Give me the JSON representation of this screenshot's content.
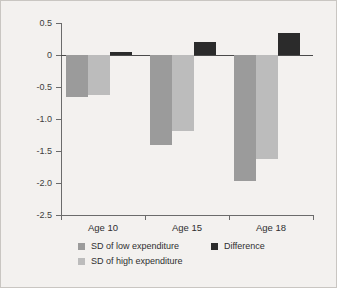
{
  "chart_data": {
    "type": "bar",
    "title": "",
    "subtitle": "",
    "xlabel": "",
    "ylabel": "",
    "categories": [
      "Age 10",
      "Age 15",
      "Age 18"
    ],
    "series": [
      {
        "name": "SD of low expenditure",
        "color": "#9b9b9b",
        "values": [
          -0.65,
          -1.41,
          -1.97
        ]
      },
      {
        "name": "SD of high expenditure",
        "color": "#bcbcbc",
        "values": [
          -0.62,
          -1.18,
          -1.62
        ]
      },
      {
        "name": "Difference",
        "color": "#2b2b2b",
        "values": [
          0.04,
          0.21,
          0.34
        ]
      }
    ],
    "ylim": [
      -2.5,
      0.5
    ],
    "ytick_labels": [
      "0.5",
      "0",
      "-0.5",
      "-1.0",
      "-1.5",
      "-2.0",
      "-2.5"
    ],
    "ytick_values": [
      0.5,
      0,
      -0.5,
      -1.0,
      -1.5,
      -2.0,
      -2.5
    ],
    "grid": false,
    "zero_line": true,
    "legend_position": "bottom",
    "background_color": "#f3f1ef",
    "axis_color": "#6b6b6b"
  },
  "legend": {
    "left_column": [
      {
        "label": "SD of low expenditure",
        "swatch": "low"
      },
      {
        "label": "SD of high expenditure",
        "swatch": "high"
      }
    ],
    "right_column": [
      {
        "label": "Difference",
        "swatch": "diff"
      }
    ]
  }
}
